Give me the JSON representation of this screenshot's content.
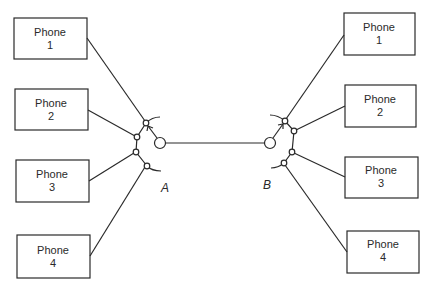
{
  "diagram": {
    "type": "telephone switching network",
    "switches": [
      {
        "id": "A",
        "label": "A"
      },
      {
        "id": "B",
        "label": "B"
      }
    ],
    "left_phones": [
      {
        "line1": "Phone",
        "line2": "1"
      },
      {
        "line1": "Phone",
        "line2": "2"
      },
      {
        "line1": "Phone",
        "line2": "3"
      },
      {
        "line1": "Phone",
        "line2": "4"
      }
    ],
    "right_phones": [
      {
        "line1": "Phone",
        "line2": "1"
      },
      {
        "line1": "Phone",
        "line2": "2"
      },
      {
        "line1": "Phone",
        "line2": "3"
      },
      {
        "line1": "Phone",
        "line2": "4"
      }
    ],
    "trunk": {
      "from": "A",
      "to": "B"
    },
    "colors": {
      "stroke": "#2a2a2a",
      "background": "#ffffff"
    }
  }
}
